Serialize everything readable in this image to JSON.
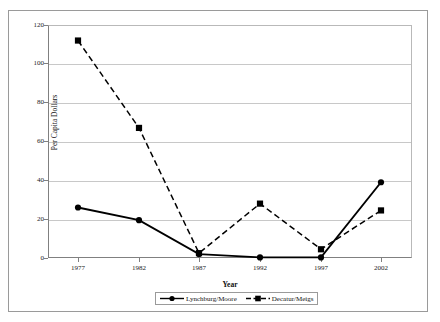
{
  "chart_data": {
    "type": "line",
    "title": "",
    "xlabel": "Year",
    "ylabel": "Per Capita Dollars",
    "categories": [
      "1977",
      "1982",
      "1987",
      "1992",
      "1997",
      "2002"
    ],
    "ylim": [
      0,
      120
    ],
    "yticks": [
      0,
      20,
      40,
      60,
      80,
      100,
      120
    ],
    "ytick_labels": [
      "0",
      "20",
      "40",
      "60",
      "80",
      "100",
      "120"
    ],
    "grid": "horizontal",
    "legend_position": "bottom-center",
    "series": [
      {
        "name": "Lynchburg/Moore",
        "values": [
          26,
          19.5,
          2,
          0.3,
          0.3,
          39
        ],
        "line_style": "solid",
        "marker": "circle",
        "color": "#000000"
      },
      {
        "name": "Decatur/Meigs",
        "values": [
          112,
          67,
          2.5,
          28,
          4.5,
          24.5
        ],
        "line_style": "dashed",
        "marker": "square",
        "color": "#000000"
      }
    ]
  },
  "axes": {
    "y_title": "Per Capita Dollars",
    "x_title": "Year",
    "y_labels": [
      "120",
      "100",
      "80",
      "60",
      "40",
      "20",
      "0"
    ],
    "x_labels": [
      "1977",
      "1982",
      "1987",
      "1992",
      "1997",
      "2002"
    ]
  },
  "legend": {
    "items": [
      {
        "label": "Lynchburg/Moore",
        "marker": "circle-marker",
        "style": "solid-line"
      },
      {
        "label": "Decatur/Meigs",
        "marker": "square-marker",
        "style": "dashed-line"
      }
    ]
  },
  "colors": {
    "series_line": "#000000",
    "gridline": "#c8c8c8",
    "axis": "#808080",
    "frame": "#9a9a9a",
    "background": "#ffffff",
    "text": "#111111"
  }
}
